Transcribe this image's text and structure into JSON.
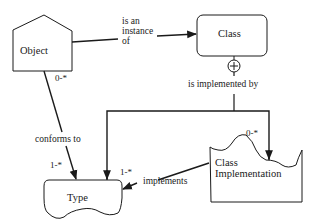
{
  "diagram": {
    "nodes": {
      "object": {
        "label": "Object",
        "shape": "pentagon"
      },
      "class": {
        "label": "Class",
        "shape": "rounded-rectangle"
      },
      "type": {
        "label": "Type",
        "shape": "wavy-bottom-box"
      },
      "class_implementation": {
        "label_line1": "Class",
        "label_line2": "Implementation",
        "shape": "wavy-top-box"
      }
    },
    "edges": {
      "instance_of": {
        "label_line1": "is an",
        "label_line2": "instance",
        "label_line3": "of",
        "from": "Object",
        "to": "Class"
      },
      "implemented_by": {
        "label": "is implemented by",
        "from": "Class",
        "to": [
          "Type",
          "Class Implementation"
        ],
        "symbol": "circle-plus"
      },
      "conforms_to": {
        "label": "conforms to",
        "from": "Object",
        "to": "Type"
      },
      "implements": {
        "label": "implements",
        "from": "Class Implementation",
        "to": "Type"
      }
    },
    "multiplicities": {
      "object_side": "0-*",
      "type_conforms_side": "1-*",
      "type_implemented_side": "1-*",
      "class_impl_side": "0-*"
    },
    "colors": {
      "ink": "#1a1a1a",
      "background": "#ffffff"
    }
  }
}
